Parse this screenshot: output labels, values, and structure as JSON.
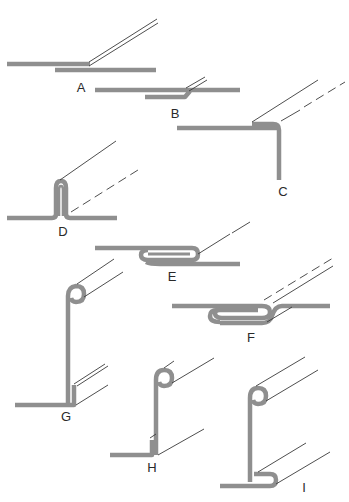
{
  "figure": {
    "colors": {
      "metal": "#8f8f8f",
      "edge_lines": "#3a3a3a",
      "labels": "#2a2a2a",
      "background": "#ffffff"
    },
    "panels": [
      {
        "id": "A",
        "label": "A",
        "form": "lap joint, two flat plates overlapping"
      },
      {
        "id": "B",
        "label": "B",
        "form": "joggled lap joint, upper plate offset down"
      },
      {
        "id": "C",
        "label": "C",
        "form": "corner joint, horizontal plate meeting vertical plate with lip"
      },
      {
        "id": "D",
        "label": "D",
        "form": "standing seam, double upright fold"
      },
      {
        "id": "E",
        "label": "E",
        "form": "grooved seam, folded hook interlock"
      },
      {
        "id": "F",
        "label": "F",
        "form": "double folded seam with offset"
      },
      {
        "id": "G",
        "label": "G",
        "form": "curled top edge, vertical plate with flanged base and upstand"
      },
      {
        "id": "H",
        "label": "H",
        "form": "curled top edge, vertical plate with short upstand at base"
      },
      {
        "id": "I",
        "label": "I",
        "form": "curled top edge, vertical plate with folded hook base"
      }
    ]
  }
}
